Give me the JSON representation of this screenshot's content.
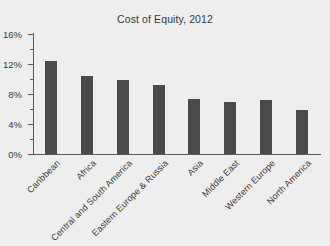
{
  "chart_data": {
    "type": "bar",
    "title": "Cost of Equity, 2012",
    "xlabel": "",
    "ylabel": "",
    "grid": false,
    "legend": null,
    "ylim": [
      0,
      16
    ],
    "ytick_labels": [
      "0%",
      "4%",
      "8%",
      "12%",
      "16%"
    ],
    "ytick_values": [
      0,
      4,
      8,
      12,
      16
    ],
    "yminor_values": [
      2,
      6,
      10,
      14
    ],
    "categories": [
      "Caribbean",
      "Africa",
      "Central and South America",
      "Eastern Europe & Russia",
      "Asia",
      "Middle East",
      "Western Europe",
      "North America"
    ],
    "values": [
      12.4,
      10.4,
      9.9,
      9.2,
      7.3,
      7.0,
      7.2,
      5.9
    ],
    "bar_color": "#4a4a4a",
    "background_color": "#eeeeee",
    "axis_color": "#5a5a5a",
    "text_color": "#3a3a3a",
    "category_label_rotation_deg": 45
  }
}
